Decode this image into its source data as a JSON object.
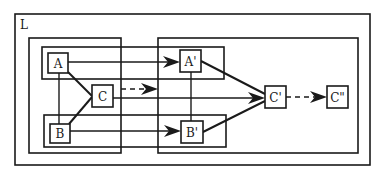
{
  "diagram": {
    "frame_label": "L",
    "nodes": {
      "A": "A",
      "B": "B",
      "C": "C",
      "A_prime": "A'",
      "B_prime": "B'",
      "C_prime": "C'",
      "C_double_prime": "C\""
    },
    "containers": [
      {
        "id": "outer-frame",
        "label": "L"
      },
      {
        "id": "left-group",
        "contains": [
          "A",
          "B",
          "C"
        ]
      },
      {
        "id": "right-group",
        "contains": [
          "A'",
          "B'",
          "C'",
          "C\""
        ]
      },
      {
        "id": "top-strip",
        "contains": [
          "A",
          "A'"
        ]
      },
      {
        "id": "bottom-strip",
        "contains": [
          "B",
          "B'"
        ]
      }
    ],
    "edges": [
      {
        "from": "A",
        "to": "A'",
        "style": "solid",
        "arrow": true
      },
      {
        "from": "B",
        "to": "B'",
        "style": "solid",
        "arrow": true
      },
      {
        "from": "C",
        "to": "C'",
        "style": "solid",
        "arrow": true
      },
      {
        "from": "C",
        "to": "right-group",
        "style": "dashed",
        "arrow": true
      },
      {
        "from": "A",
        "to": "B",
        "style": "solid",
        "arrow": false
      },
      {
        "from": "A",
        "to": "C",
        "style": "solid",
        "arrow": false
      },
      {
        "from": "B",
        "to": "C",
        "style": "solid",
        "arrow": false
      },
      {
        "from": "A'",
        "to": "B'",
        "style": "solid",
        "arrow": false
      },
      {
        "from": "A'",
        "to": "C'",
        "style": "solid",
        "arrow": false
      },
      {
        "from": "B'",
        "to": "C'",
        "style": "solid",
        "arrow": false
      },
      {
        "from": "C'",
        "to": "C\"",
        "style": "dashed",
        "arrow": true
      }
    ],
    "colors": {
      "stroke": "#1a1a1a",
      "background": "#ffffff"
    }
  }
}
